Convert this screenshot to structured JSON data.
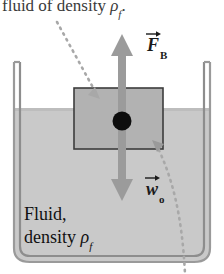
{
  "figure": {
    "caption_top": "fluid of density ",
    "caption_top_rho": "ρ",
    "caption_top_sub": "f",
    "caption_top_end": ".",
    "fluid_label_line1": "Fluid,",
    "fluid_label_line2": "density ",
    "fluid_label_rho": "ρ",
    "fluid_label_sub": "f"
  },
  "vectors": {
    "buoyant": {
      "symbol": "F",
      "subscript": "B",
      "direction": "up",
      "name": "buoyant-force"
    },
    "weight": {
      "symbol": "w",
      "subscript": "o",
      "direction": "down",
      "name": "weight-of-object"
    }
  },
  "colors": {
    "fluid_fill": "#c9c9c9",
    "block_fill": "#b0b0b0",
    "arrow_gray": "#999999",
    "wall_gray": "#b5b5b5",
    "outline": "#4a4a4a",
    "dot_black": "#0d0d0d",
    "leader_gray": "#a6a6a6",
    "text": "#1a1a1a"
  },
  "geometry": {
    "fluid_surface_y": 108,
    "container_left_x": 14,
    "container_right_x": 210,
    "container_bottom_y": 262,
    "block": {
      "x": 74,
      "y": 88,
      "width": 89,
      "height": 61
    },
    "center_dot": {
      "cx": 122,
      "cy": 121,
      "r": 9
    }
  }
}
